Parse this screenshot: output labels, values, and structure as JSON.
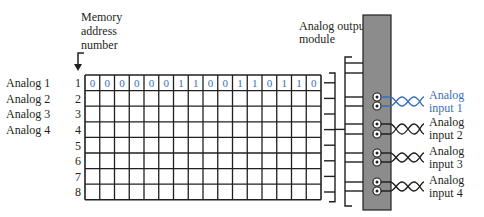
{
  "labels": {
    "memory_address": [
      "Memory",
      "address",
      "number"
    ],
    "module": [
      "Analog output",
      "module"
    ]
  },
  "rows": [
    {
      "name": "Analog 1",
      "address": "1"
    },
    {
      "name": "Analog 2",
      "address": "2"
    },
    {
      "name": "Analog 3",
      "address": "3"
    },
    {
      "name": "Analog 4",
      "address": "4"
    },
    {
      "name": "",
      "address": "5"
    },
    {
      "name": "",
      "address": "6"
    },
    {
      "name": "",
      "address": "7"
    },
    {
      "name": "",
      "address": "8"
    }
  ],
  "word1_bits": [
    "0",
    "0",
    "0",
    "0",
    "0",
    "0",
    "1",
    "1",
    "0",
    "0",
    "1",
    "1",
    "0",
    "1",
    "1",
    "0"
  ],
  "inputs": [
    {
      "line1": "Analog",
      "line2": "input 1",
      "highlight": true
    },
    {
      "line1": "Analog",
      "line2": "input 2",
      "highlight": false
    },
    {
      "line1": "Analog",
      "line2": "input 3",
      "highlight": false
    },
    {
      "line1": "Analog",
      "line2": "input 4",
      "highlight": false
    }
  ],
  "colors": {
    "highlight": "#3a6fb5",
    "module_fill": "#8c8c8c",
    "line": "#231f20"
  }
}
